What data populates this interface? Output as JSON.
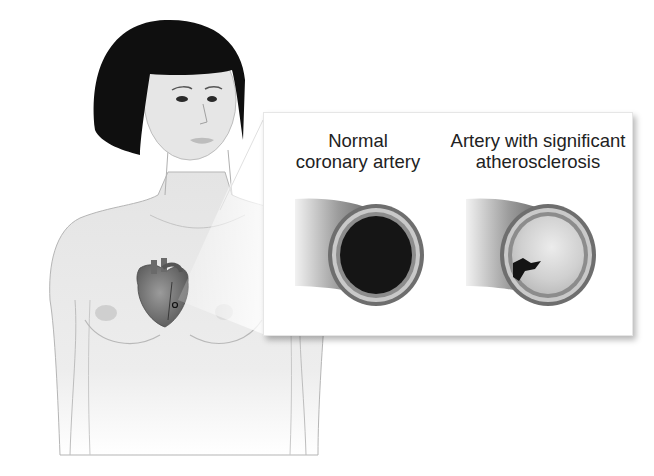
{
  "figure": {
    "callout": {
      "normal_artery": {
        "label_line1": "Normal",
        "label_line2": "coronary artery",
        "lumen_state": "open"
      },
      "diseased_artery": {
        "label_line1": "Artery with significant",
        "label_line2": "atherosclerosis",
        "lumen_state": "mostly blocked by plaque"
      }
    },
    "colors": {
      "hair": "#0d0d0d",
      "skin": "#e9e9e9",
      "outline": "#9a9a9a",
      "artery_wall": "#7a7a7a",
      "lumen_open": "#141414",
      "plaque": "#d4d4d4",
      "heart": "#6e6e6e"
    }
  }
}
